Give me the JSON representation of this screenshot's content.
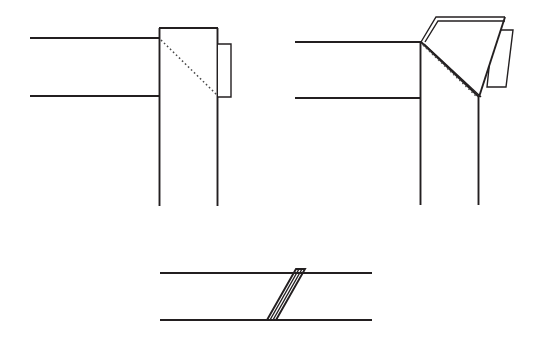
{
  "document": {
    "title": "Folded flap construction diagram",
    "type": "technical-line-drawing",
    "background_color": "#ffffff",
    "line_color": "#231f20",
    "hidden_line_color": "#4a4a4a",
    "width": 538,
    "height": 351
  },
  "figures": [
    {
      "id": "figure-unfolded",
      "name": "top-left-unfolded-view",
      "label": "",
      "description": "Flat strip meeting a vertical panel, with hidden diagonal fold line and a narrow tab on the right edge",
      "geometry": {
        "strip_top_line": {
          "x1": 30,
          "y1": 38,
          "x2": 160,
          "y2": 38
        },
        "strip_bottom_line": {
          "x1": 30,
          "y1": 96,
          "x2": 160,
          "y2": 96
        },
        "panel_rect": {
          "x": 159,
          "y": 28,
          "width": 59,
          "height": 178
        },
        "panel_top_edge": {
          "x1": 159,
          "y1": 28,
          "x2": 218,
          "y2": 28
        },
        "panel_left_edge": {
          "x1": 159,
          "y1": 28,
          "x2": 159,
          "y2": 206
        },
        "panel_right_edge": {
          "x1": 218,
          "y1": 28,
          "x2": 218,
          "y2": 206
        },
        "tab_rect": {
          "x": 218,
          "y": 44,
          "width": 13,
          "height": 53
        },
        "hidden_fold_line": {
          "x1": 161,
          "y1": 40,
          "x2": 217,
          "y2": 95
        }
      }
    },
    {
      "id": "figure-folded",
      "name": "top-right-folded-view",
      "label": "",
      "description": "Same strip with the triangular flap rotated up and out along the fold line, showing material thickness",
      "geometry": {
        "strip_top_line": {
          "x1": 295,
          "y1": 42,
          "x2": 420,
          "y2": 42
        },
        "strip_bottom_line": {
          "x1": 295,
          "y1": 98,
          "x2": 420,
          "y2": 98
        },
        "panel_left_edge": {
          "x1": 420,
          "y1": 42,
          "x2": 420,
          "y2": 205
        },
        "panel_right_edge": {
          "x1": 478,
          "y1": 98,
          "x2": 478,
          "y2": 205
        },
        "hidden_fold_line": {
          "x1": 422,
          "y1": 44,
          "x2": 477,
          "y2": 97
        },
        "flap_triangle": [
          {
            "x": 421,
            "y": 42
          },
          {
            "x": 436,
            "y": 17
          },
          {
            "x": 505,
            "y": 17
          },
          {
            "x": 479,
            "y": 97
          }
        ],
        "flap_thickness_edge": {
          "x1": 421,
          "y1": 42,
          "x2": 479,
          "y2": 97
        },
        "tab_quad": [
          {
            "x": 493,
            "y": 30
          },
          {
            "x": 513,
            "y": 30
          },
          {
            "x": 506,
            "y": 87
          },
          {
            "x": 487,
            "y": 87
          }
        ]
      }
    },
    {
      "id": "figure-section",
      "name": "bottom-edge-on-section-view",
      "label": "",
      "description": "Edge-on section showing the flap as a thin parallelogram spanning between two parallel surfaces",
      "geometry": {
        "top_line": {
          "x1": 160,
          "y1": 273,
          "x2": 372,
          "y2": 273
        },
        "bottom_line": {
          "x1": 160,
          "y1": 320,
          "x2": 372,
          "y2": 320
        },
        "flap_parallelogram": [
          {
            "x": 267,
            "y": 320
          },
          {
            "x": 296,
            "y": 269
          },
          {
            "x": 305,
            "y": 269
          },
          {
            "x": 276,
            "y": 320
          }
        ],
        "interior_rules": [
          {
            "x1": 270,
            "y1": 320,
            "x2": 299,
            "y2": 269
          },
          {
            "x1": 273,
            "y1": 320,
            "x2": 302,
            "y2": 269
          }
        ]
      }
    }
  ]
}
